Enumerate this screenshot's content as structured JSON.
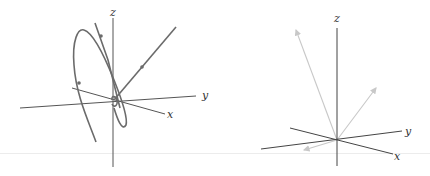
{
  "figure": {
    "left_panel": {
      "description": "3D axes with a closed loop trajectory (ellipse) and a straight trajectory through the origin, with direction arrows",
      "axes": {
        "x_label": "x",
        "y_label": "y",
        "z_label": "z"
      },
      "colors": {
        "axis": "#555555",
        "curve": "#6b6b6b"
      }
    },
    "right_panel": {
      "description": "3D axes with three light gray vectors emanating from the origin",
      "axes": {
        "x_label": "x",
        "y_label": "y",
        "z_label": "z"
      },
      "colors": {
        "axis": "#444444",
        "vector": "#c8c8c8"
      }
    }
  }
}
